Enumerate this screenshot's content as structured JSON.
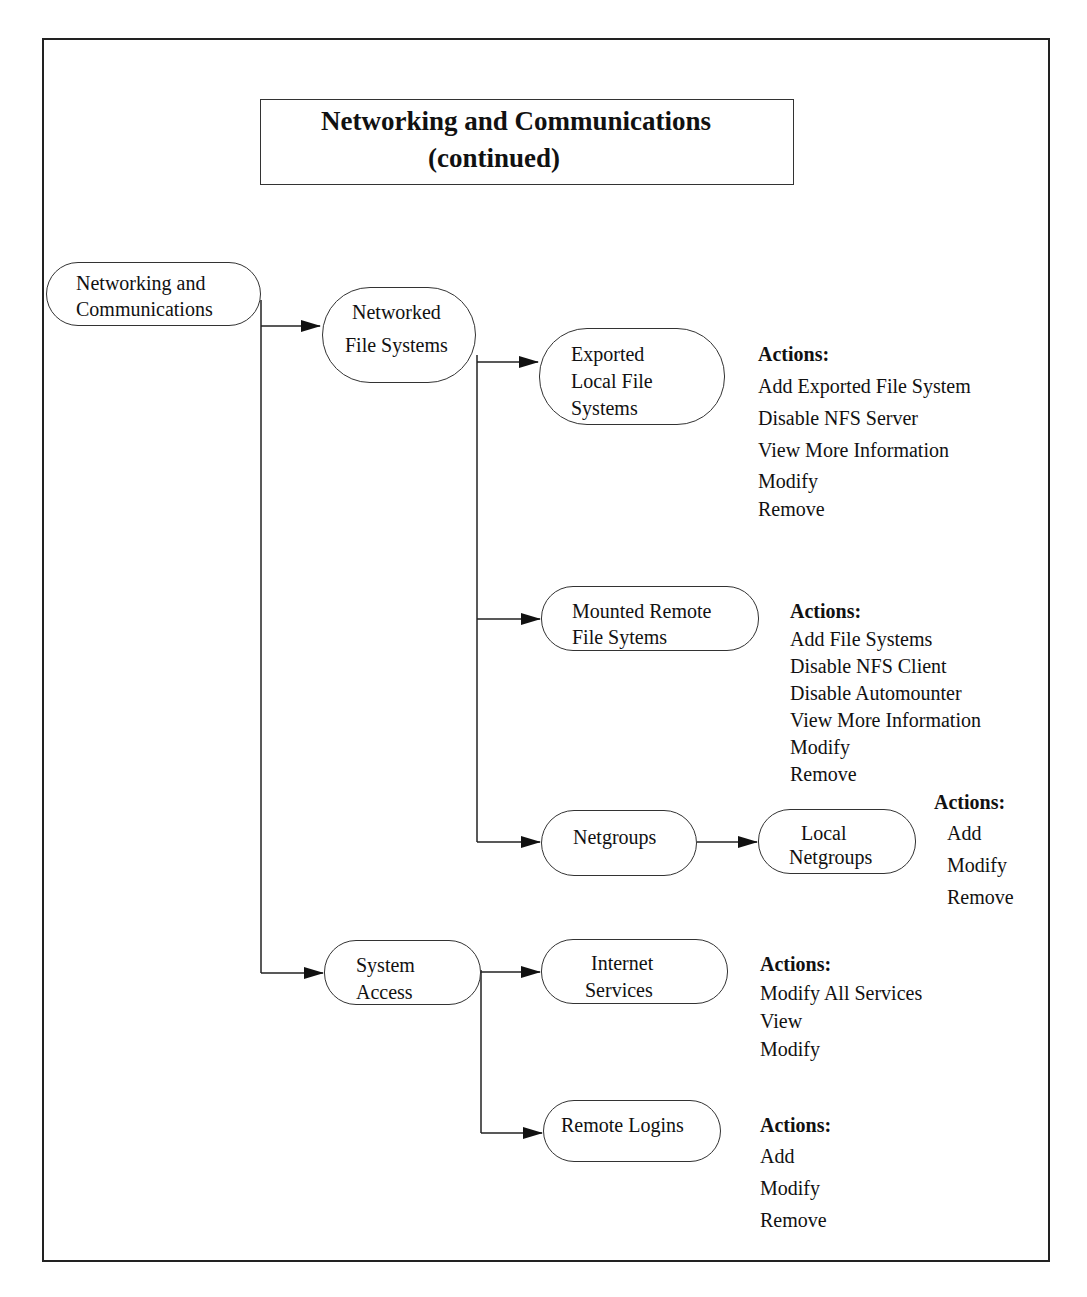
{
  "title": {
    "line1": "Networking and Communications",
    "line2": "(continued)"
  },
  "nodes": {
    "root": {
      "line1": "Networking and",
      "line2": "Communications"
    },
    "networked_fs": {
      "line1": "Networked",
      "line2": "File Systems"
    },
    "exported_fs": {
      "line1": "Exported",
      "line2": "Local File",
      "line3": "Systems"
    },
    "mounted_fs": {
      "line1": "Mounted Remote",
      "line2": "File Sytems"
    },
    "netgroups": {
      "line1": "Netgroups"
    },
    "local_netgroups": {
      "line1": "Local",
      "line2": "Netgroups"
    },
    "system_access": {
      "line1": "System",
      "line2": "Access"
    },
    "internet_services": {
      "line1": "Internet",
      "line2": "Services"
    },
    "remote_logins": {
      "line1": "Remote Logins"
    }
  },
  "actions": {
    "exported_fs": {
      "header": "Actions:",
      "items": [
        "Add Exported File System",
        "Disable NFS Server",
        "View More Information",
        "Modify",
        "Remove"
      ]
    },
    "mounted_fs": {
      "header": "Actions:",
      "items": [
        "Add File Systems",
        "Disable NFS Client",
        "Disable Automounter",
        "View More Information",
        "Modify",
        "Remove"
      ]
    },
    "local_netgroups": {
      "header": "Actions:",
      "items": [
        "Add",
        "Modify",
        "Remove"
      ]
    },
    "internet_services": {
      "header": "Actions:",
      "items": [
        "Modify All Services",
        "View",
        "Modify"
      ]
    },
    "remote_logins": {
      "header": "Actions:",
      "items": [
        "Add",
        "Modify",
        "Remove"
      ]
    }
  },
  "colors": {
    "line": "#222222",
    "background": "#ffffff"
  }
}
